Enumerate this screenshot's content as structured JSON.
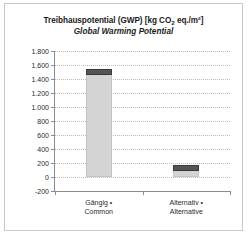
{
  "chart_data": {
    "type": "bar",
    "title": "Treibhauspotential (GWP) [kg CO2 eq./m²]",
    "title_main": "Treibhauspotential (GWP) [kg CO",
    "title_sub": "2",
    "title_tail": " eq./m²]",
    "subtitle": "Global Warming Potential",
    "categories": [
      "Gängig • Common",
      "Alternativ • Alternative"
    ],
    "category_lines": [
      [
        "Gängig •",
        "Common"
      ],
      [
        "Alternativ •",
        "Alternative"
      ]
    ],
    "values": [
      1550,
      165
    ],
    "xlabel": "",
    "ylabel": "",
    "ylim": [
      -200,
      1800
    ],
    "ytick_labels": [
      "1.800",
      "1.600",
      "1.400",
      "1.200",
      "1.000",
      "800",
      "600",
      "400",
      "200",
      "0",
      "-200"
    ],
    "ytick_values": [
      1800,
      1600,
      1400,
      1200,
      1000,
      800,
      600,
      400,
      200,
      0,
      -200
    ],
    "grid": true,
    "legend": "none",
    "colors": {
      "bar_fill": "#d4d4d4",
      "bar_cap": "#555555",
      "axis": "#8c8c8c",
      "grid": "#bdbdbd",
      "text": "#1b1b1b",
      "card_border": "#c9c9c9",
      "background": "#ffffff"
    }
  }
}
